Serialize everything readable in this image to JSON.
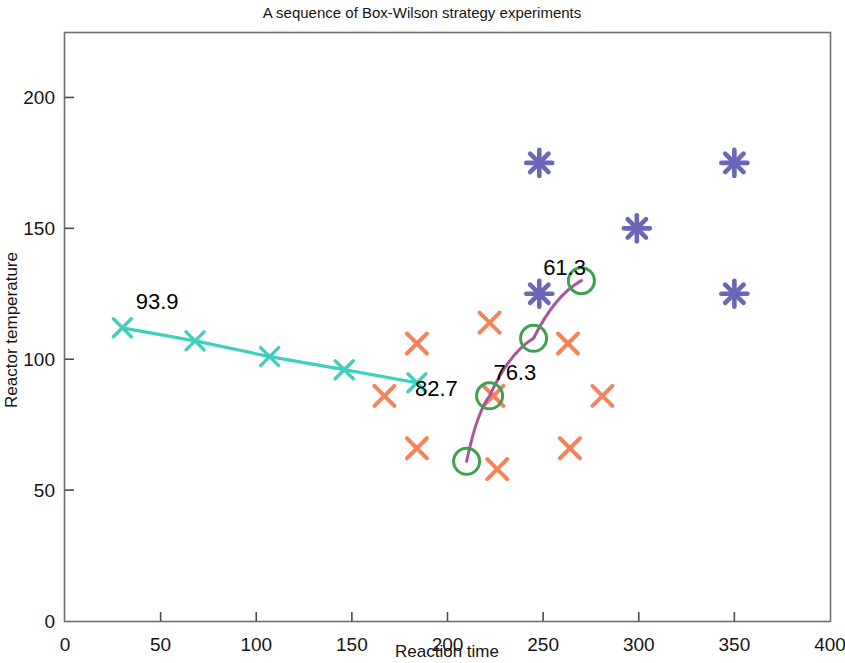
{
  "chart_data": {
    "type": "scatter",
    "title": "A sequence of Box-Wilson strategy experiments",
    "xlabel": "Reaction time",
    "ylabel": "Reactor temperature",
    "xlim": [
      0,
      400
    ],
    "ylim": [
      0,
      225
    ],
    "xticks": [
      0,
      50,
      100,
      150,
      200,
      250,
      300,
      350,
      400
    ],
    "yticks": [
      0,
      50,
      100,
      150,
      200
    ],
    "grid": false,
    "legend": "none",
    "series": [
      {
        "name": "First factorial design (orange crosses)",
        "marker": "x",
        "color": "#f58258",
        "points": [
          {
            "x": 167,
            "y": 86
          },
          {
            "x": 184,
            "y": 106
          },
          {
            "x": 184,
            "y": 66
          }
        ]
      },
      {
        "name": "Steepest ascent path 1 (teal line with x markers)",
        "marker": "x-line",
        "color": "#3ecfc0",
        "points": [
          {
            "x": 30,
            "y": 112
          },
          {
            "x": 68,
            "y": 107
          },
          {
            "x": 107,
            "y": 101
          },
          {
            "x": 146,
            "y": 96
          },
          {
            "x": 184,
            "y": 91
          }
        ]
      },
      {
        "name": "Second factorial design (orange crosses)",
        "marker": "x",
        "color": "#f58258",
        "points": [
          {
            "x": 224,
            "y": 86
          },
          {
            "x": 222,
            "y": 114
          },
          {
            "x": 226,
            "y": 58
          },
          {
            "x": 263,
            "y": 106
          },
          {
            "x": 281,
            "y": 86
          },
          {
            "x": 264,
            "y": 66
          }
        ]
      },
      {
        "name": "Steepest ascent path 2 (magenta curve with green circles)",
        "marker": "o-line",
        "color": "#a8559a",
        "marker_color": "#3fa050",
        "points": [
          {
            "x": 210,
            "y": 61
          },
          {
            "x": 222,
            "y": 86
          },
          {
            "x": 245,
            "y": 108
          },
          {
            "x": 270,
            "y": 130
          }
        ]
      },
      {
        "name": "Third design region (purple asterisks)",
        "marker": "asterisk",
        "color": "#6a66b8",
        "points": [
          {
            "x": 248,
            "y": 175
          },
          {
            "x": 350,
            "y": 175
          },
          {
            "x": 299,
            "y": 150
          },
          {
            "x": 248,
            "y": 125
          },
          {
            "x": 350,
            "y": 125
          }
        ]
      }
    ],
    "annotations": [
      {
        "text": "93.9",
        "x": 37,
        "y": 119,
        "anchor": "start"
      },
      {
        "text": "82.7",
        "x": 183,
        "y": 86,
        "anchor": "start"
      },
      {
        "text": "76.3",
        "x": 224,
        "y": 92,
        "anchor": "start"
      },
      {
        "text": "61.3",
        "x": 250,
        "y": 132,
        "anchor": "start"
      }
    ]
  }
}
